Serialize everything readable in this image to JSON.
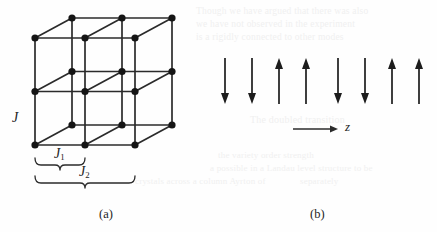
{
  "figure": {
    "panels": [
      {
        "id": "a",
        "caption": "(a)",
        "kind": "lattice-diagram",
        "description": "three-dimensional cubic lattice of spin sites drawn in oblique projection",
        "labels": {
          "coupling_vertical": "J",
          "coupling_nearest": "J",
          "coupling_nearest_sub": "1",
          "coupling_next_nearest": "J",
          "coupling_next_nearest_sub": "2"
        },
        "lattice": {
          "columns": 3,
          "rows": 3,
          "depth_layers": 2,
          "origin_x": 35,
          "origin_y": 145,
          "step_x": 50,
          "step_y": -53.5,
          "depth_dx": 37,
          "depth_dy": -20,
          "node_radius": 3.6,
          "line_width": 1.7,
          "node_color": "#151515",
          "line_color": "#2b2b2b"
        },
        "braces": {
          "inner": {
            "x1": 35,
            "x2": 85,
            "y": 158,
            "label_x": 54,
            "label_y": 160
          },
          "outer": {
            "x1": 35,
            "x2": 135,
            "y": 176,
            "label_x": 79,
            "label_y": 178
          }
        }
      },
      {
        "id": "b",
        "caption": "(b)",
        "kind": "spin-chain-diagram",
        "description": "one-dimensional chain of spins showing an up-up-down-down striped ordering along z",
        "axis": {
          "label": "z",
          "x1": 293,
          "x2": 338,
          "y": 129,
          "line_width": 1.6,
          "color": "#2b2b2b"
        },
        "spins": [
          {
            "index": 1,
            "direction": "down",
            "x": 225
          },
          {
            "index": 2,
            "direction": "down",
            "x": 252
          },
          {
            "index": 3,
            "direction": "up",
            "x": 279
          },
          {
            "index": 4,
            "direction": "up",
            "x": 306
          },
          {
            "index": 5,
            "direction": "down",
            "x": 338
          },
          {
            "index": 6,
            "direction": "down",
            "x": 365
          },
          {
            "index": 7,
            "direction": "up",
            "x": 392
          },
          {
            "index": 8,
            "direction": "up",
            "x": 419
          }
        ],
        "arrow": {
          "top_y": 58,
          "bottom_y": 104,
          "shaft_width": 1.7,
          "head_width": 8,
          "head_length": 11,
          "color": "#1d1d1d"
        }
      }
    ],
    "caption_positions": {
      "a": {
        "x": 99,
        "y": 207
      },
      "b": {
        "x": 310,
        "y": 207
      }
    },
    "colors": {
      "ink": "#1d1d1d",
      "line": "#2b2b2b",
      "node": "#151515",
      "page": "#fefefe",
      "ghost": "#f0f0f0"
    }
  },
  "ghost_text": {
    "lines": [
      {
        "text": "Though we have argued that there was also",
        "x": 196,
        "y": 6,
        "size": 9.5
      },
      {
        "text": "we have not observed in the experiment",
        "x": 196,
        "y": 19,
        "size": 9.5
      },
      {
        "text": "is a rigidly connected to other modes",
        "x": 196,
        "y": 32,
        "size": 9.5
      },
      {
        "text": "The doubled transition",
        "x": 250,
        "y": 114,
        "size": 10
      },
      {
        "text": "the variety order strength",
        "x": 218,
        "y": 150,
        "size": 9
      },
      {
        "text": "a possible in a Landau level structure to be",
        "x": 210,
        "y": 163,
        "size": 9
      },
      {
        "text": "separately",
        "x": 300,
        "y": 176,
        "size": 9
      },
      {
        "text": "crystals across a column Ayrton of",
        "x": 135,
        "y": 176,
        "size": 9
      }
    ]
  }
}
